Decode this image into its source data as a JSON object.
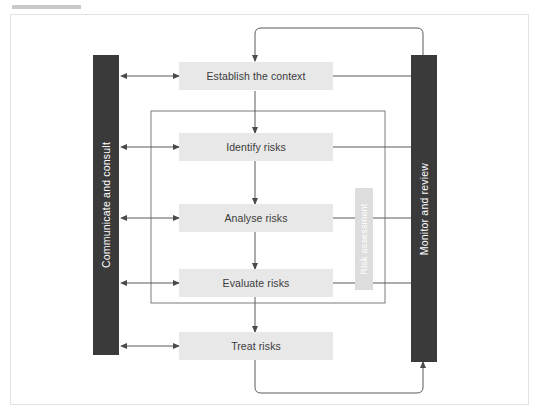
{
  "figure": {
    "title_bar_redacted": true
  },
  "diagram": {
    "type": "risk-management-process-flowchart",
    "side_bars": [
      {
        "id": "communicate",
        "label": "Communicate and consult",
        "side": "left",
        "color": "#3a3a3a"
      },
      {
        "id": "monitor",
        "label": "Monitor and review",
        "side": "right",
        "color": "#3a3a3a"
      }
    ],
    "group_label": {
      "id": "risk-assessment",
      "label": "Risk assessment",
      "color": "#dddddd"
    },
    "steps": [
      {
        "id": "establish-context",
        "label": "Establish the context"
      },
      {
        "id": "identify-risks",
        "label": "Identify risks"
      },
      {
        "id": "analyse-risks",
        "label": "Analyse risks"
      },
      {
        "id": "evaluate-risks",
        "label": "Evaluate risks"
      },
      {
        "id": "treat-risks",
        "label": "Treat risks"
      }
    ],
    "colors": {
      "box_fill": "#e8e8e8",
      "box_text": "#3b3b3b",
      "bar_fill": "#3a3a3a",
      "bar_text": "#ffffff",
      "connector": "#555555",
      "frame": "#e2e2e2",
      "background": "#ffffff"
    }
  }
}
